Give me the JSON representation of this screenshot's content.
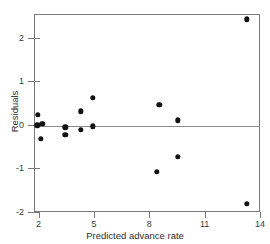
{
  "chart_data": {
    "type": "scatter",
    "title": "",
    "xlabel": "Predicted advance rate",
    "ylabel": "Residuals",
    "xlim": [
      1.75,
      14.0
    ],
    "ylim": [
      -2.0,
      2.55
    ],
    "xticks": [
      2,
      5,
      8,
      11,
      14
    ],
    "xticklabels": [
      "2",
      "5",
      "8",
      "11",
      "14"
    ],
    "yticks": [
      2,
      1,
      0,
      -1,
      -2
    ],
    "yticklabels": [
      "2",
      "1",
      "0",
      "-1",
      "-2"
    ],
    "grid": false,
    "legend": null,
    "reference_lines": [
      {
        "orientation": "horizontal",
        "value": 0,
        "color": "#8a8a8a"
      }
    ],
    "marker": {
      "shape": "circle",
      "color": "#111111",
      "size": 5.4
    },
    "points": [
      {
        "x": 1.95,
        "y": 0.24
      },
      {
        "x": 1.92,
        "y": -0.01
      },
      {
        "x": 2.2,
        "y": 0.03
      },
      {
        "x": 2.13,
        "y": -0.32
      },
      {
        "x": 3.45,
        "y": -0.05
      },
      {
        "x": 3.45,
        "y": -0.22
      },
      {
        "x": 4.28,
        "y": 0.31
      },
      {
        "x": 4.3,
        "y": -0.11
      },
      {
        "x": 4.95,
        "y": 0.63
      },
      {
        "x": 4.95,
        "y": -0.03
      },
      {
        "x": 8.55,
        "y": 0.47
      },
      {
        "x": 8.42,
        "y": -1.07
      },
      {
        "x": 9.55,
        "y": 0.11
      },
      {
        "x": 9.55,
        "y": -0.73
      },
      {
        "x": 13.3,
        "y": 2.43
      },
      {
        "x": 13.3,
        "y": -1.81
      }
    ]
  },
  "figure": {
    "x_axis_title": "Predicted advance rate",
    "y_axis_title": "Residuals",
    "x_tick_labels": [
      "2",
      "5",
      "8",
      "11",
      "14"
    ],
    "y_tick_labels": [
      "2",
      "1",
      "0",
      "-1",
      "-2"
    ]
  },
  "colors": {
    "marker": "#111111",
    "axis": "#7a7a7a",
    "zero_line": "#8a8a8a",
    "text": "#2f2f2f",
    "background": "#ffffff"
  }
}
